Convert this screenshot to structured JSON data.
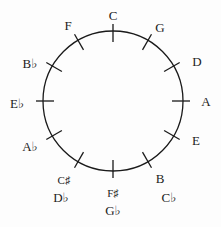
{
  "circle": {
    "cx": 113,
    "cy": 101,
    "r": 70,
    "stroke": "#1a1a1a"
  },
  "keys": [
    {
      "name": "C",
      "angle": 0,
      "labels": [
        "C"
      ]
    },
    {
      "name": "G",
      "angle": 30,
      "labels": [
        "G"
      ]
    },
    {
      "name": "D",
      "angle": 60,
      "labels": [
        "D"
      ]
    },
    {
      "name": "A",
      "angle": 90,
      "labels": [
        "A"
      ]
    },
    {
      "name": "E",
      "angle": 120,
      "labels": [
        "E"
      ]
    },
    {
      "name": "B",
      "angle": 150,
      "labels": [
        "B",
        "C♭"
      ]
    },
    {
      "name": "F♯",
      "angle": 180,
      "labels": [
        "F♯",
        "G♭"
      ]
    },
    {
      "name": "C♯",
      "angle": 210,
      "labels": [
        "C♯",
        "D♭"
      ]
    },
    {
      "name": "A♭",
      "angle": 240,
      "labels": [
        "A♭"
      ]
    },
    {
      "name": "E♭",
      "angle": 270,
      "labels": [
        "E♭"
      ]
    },
    {
      "name": "B♭",
      "angle": 300,
      "labels": [
        "B♭"
      ]
    },
    {
      "name": "F",
      "angle": 330,
      "labels": [
        "F"
      ]
    }
  ]
}
